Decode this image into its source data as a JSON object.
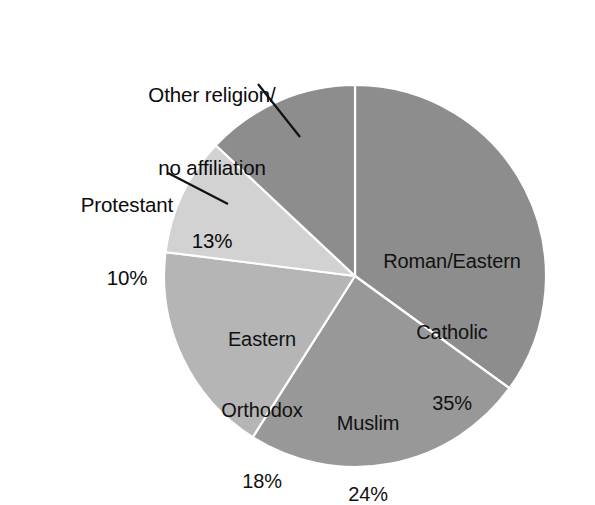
{
  "figure": {
    "background_color": "#ffffff",
    "width": 595,
    "height": 497
  },
  "chart_data": {
    "type": "pie",
    "title": "",
    "xlabel": "",
    "ylabel": "",
    "legend_position": "none",
    "grid": false,
    "units": "percent",
    "total": 100,
    "start_angle_deg": 90,
    "direction": "clockwise",
    "center_px": [
      355,
      276
    ],
    "radius_px": 191,
    "categories": [
      "Roman/Eastern Catholic",
      "Muslim",
      "Eastern Orthodox",
      "Protestant",
      "Other religion/no affiliation"
    ],
    "values": [
      35,
      24,
      18,
      10,
      13
    ],
    "slices": [
      {
        "key": "catholic",
        "label_line1": "Roman/Eastern",
        "label_line2": "Catholic",
        "value": 35,
        "value_label": "35%",
        "color": "#8d8d8d",
        "label_placement": "inside",
        "start_deg": 0,
        "end_deg": 126
      },
      {
        "key": "muslim",
        "label_line1": "Muslim",
        "label_line2": "",
        "value": 24,
        "value_label": "24%",
        "color": "#989898",
        "label_placement": "inside",
        "start_deg": 126,
        "end_deg": 212.4
      },
      {
        "key": "orthodox",
        "label_line1": "Eastern",
        "label_line2": "Orthodox",
        "value": 18,
        "value_label": "18%",
        "color": "#b5b5b5",
        "label_placement": "inside",
        "start_deg": 212.4,
        "end_deg": 277.2
      },
      {
        "key": "protestant",
        "label_line1": "Protestant",
        "label_line2": "",
        "value": 10,
        "value_label": "10%",
        "color": "#d2d2d2",
        "label_placement": "outside",
        "start_deg": 277.2,
        "end_deg": 313.2
      },
      {
        "key": "other",
        "label_line1": "Other religion/",
        "label_line2": "no affiliation",
        "value": 13,
        "value_label": "13%",
        "color": "#8d8d8d",
        "label_placement": "outside",
        "start_deg": 313.2,
        "end_deg": 360
      }
    ],
    "slice_separator_color": "#ffffff",
    "leader_line_color": "#111111"
  },
  "labels": {
    "other": {
      "line1": "Other religion/",
      "line2": "no affiliation",
      "pct": "13%"
    },
    "protestant": {
      "line1": "Protestant",
      "pct": "10%"
    },
    "catholic": {
      "line1": "Roman/Eastern",
      "line2": "Catholic",
      "pct": "35%"
    },
    "muslim": {
      "line1": "Muslim",
      "pct": "24%"
    },
    "orthodox": {
      "line1": "Eastern",
      "line2": "Orthodox",
      "pct": "18%"
    }
  }
}
